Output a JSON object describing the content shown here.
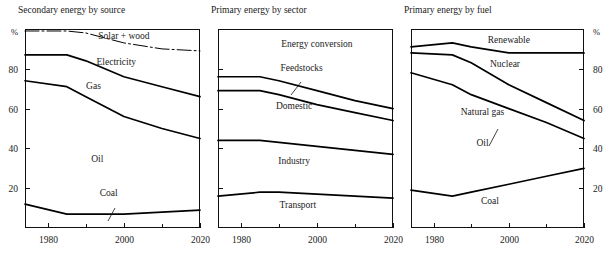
{
  "figure": {
    "width": 615,
    "height": 258,
    "background": "#ffffff",
    "ink_color": "#000000"
  },
  "chart_data": [
    {
      "type": "area",
      "title": "Secondary energy by source",
      "xlabel": "",
      "ylabel": "",
      "yunit": "%",
      "xlim": [
        1974,
        2020
      ],
      "ylim": [
        0,
        100
      ],
      "xticks": [
        1980,
        2000,
        2020
      ],
      "xtick_labels": [
        "1980",
        "2000",
        "2020"
      ],
      "xminorticks": [
        1990,
        2010
      ],
      "yticks": [
        20,
        40,
        60,
        80
      ],
      "ytick_labels": [
        "20",
        "40",
        "60",
        "80"
      ],
      "ytick_side": "left",
      "grid": false,
      "legend": "inline-band-labels",
      "x": [
        1974,
        1985,
        1990,
        2000,
        2010,
        2020
      ],
      "series": [
        {
          "name": "Solar + wood",
          "label": "Solar + wood",
          "label_x": 2000,
          "label_y": 95,
          "boundary_style": "dashed",
          "cumulative_top": [
            99,
            99,
            98,
            93,
            90,
            89
          ]
        },
        {
          "name": "Electricity",
          "label": "Electricity",
          "label_x": 1998,
          "label_y": 82,
          "boundary_style": "solid",
          "cumulative_top": [
            87,
            87,
            84,
            76,
            71,
            66
          ]
        },
        {
          "name": "Gas",
          "label": "Gas",
          "label_x": 1992,
          "label_y": 70,
          "boundary_style": "solid",
          "cumulative_top": [
            74,
            71,
            66,
            56,
            50,
            45
          ]
        },
        {
          "name": "Oil",
          "label": "Oil",
          "label_x": 1993,
          "label_y": 33,
          "boundary_style": "solid",
          "cumulative_top": [
            12,
            7,
            7,
            7,
            8,
            9
          ]
        },
        {
          "name": "Coal",
          "label": "Coal",
          "label_x": 1996,
          "label_y": 16,
          "boundary_style": "none",
          "cumulative_top": [
            0,
            0,
            0,
            0,
            0,
            0
          ]
        }
      ]
    },
    {
      "type": "area",
      "title": "Primary energy by sector",
      "xlabel": "",
      "ylabel": "",
      "yunit": "",
      "xlim": [
        1974,
        2020
      ],
      "ylim": [
        0,
        100
      ],
      "xticks": [
        1980,
        2000,
        2020
      ],
      "xtick_labels": [
        "1980",
        "2000",
        "2020"
      ],
      "xminorticks": [
        1990,
        2010
      ],
      "yticks": [
        20,
        40,
        60,
        80
      ],
      "ytick_labels": [
        "",
        "",
        "",
        ""
      ],
      "ytick_side": "left",
      "grid": false,
      "legend": "inline-band-labels",
      "x": [
        1974,
        1985,
        1990,
        2000,
        2010,
        2020
      ],
      "series": [
        {
          "name": "Energy conversion",
          "label": "Energy conversion",
          "label_x": 2000,
          "label_y": 91,
          "boundary_style": "none",
          "cumulative_top": [
            100,
            100,
            100,
            100,
            100,
            100
          ]
        },
        {
          "name": "Feedstocks",
          "label": "Feedstocks",
          "label_x": 1996,
          "label_y": 79,
          "boundary_style": "solid",
          "cumulative_top": [
            76,
            76,
            74,
            69,
            64,
            60
          ]
        },
        {
          "name": "Domestic",
          "label": "Domestic",
          "label_x": 1994,
          "label_y": 60,
          "boundary_style": "solid",
          "cumulative_top": [
            69,
            69,
            67,
            62,
            58,
            54
          ]
        },
        {
          "name": "Industry",
          "label": "Industry",
          "label_x": 1994,
          "label_y": 32,
          "boundary_style": "solid",
          "cumulative_top": [
            44,
            44,
            43,
            41,
            39,
            37
          ]
        },
        {
          "name": "Transport",
          "label": "Transport",
          "label_x": 1995,
          "label_y": 10,
          "boundary_style": "solid",
          "cumulative_top": [
            16,
            18,
            18,
            17,
            16,
            15
          ]
        }
      ]
    },
    {
      "type": "area",
      "title": "Primary energy by fuel",
      "xlabel": "",
      "ylabel": "",
      "yunit": "%",
      "xlim": [
        1974,
        2020
      ],
      "ylim": [
        0,
        100
      ],
      "xticks": [
        1980,
        2000,
        2020
      ],
      "xtick_labels": [
        "1980",
        "2000",
        "2020"
      ],
      "xminorticks": [
        1990,
        2010
      ],
      "yticks": [
        20,
        40,
        60,
        80
      ],
      "ytick_labels": [
        "20",
        "40",
        "60",
        "80"
      ],
      "ytick_side": "right",
      "grid": false,
      "legend": "inline-band-labels",
      "x": [
        1974,
        1985,
        1990,
        2000,
        2010,
        2020
      ],
      "series": [
        {
          "name": "Renewable",
          "label": "Renewable",
          "label_x": 2000,
          "label_y": 93,
          "boundary_style": "solid",
          "cumulative_top": [
            91,
            93,
            91,
            88,
            88,
            88
          ]
        },
        {
          "name": "Nuclear",
          "label": "Nuclear",
          "label_x": 1999,
          "label_y": 81,
          "boundary_style": "solid",
          "cumulative_top": [
            88,
            87,
            83,
            72,
            63,
            54
          ]
        },
        {
          "name": "Natural gas",
          "label": "Natural gas",
          "label_x": 1993,
          "label_y": 57,
          "boundary_style": "solid",
          "cumulative_top": [
            78,
            72,
            67,
            60,
            53,
            45
          ]
        },
        {
          "name": "Oil",
          "label": "Oil",
          "label_x": 1993,
          "label_y": 41,
          "boundary_style": "solid",
          "cumulative_top": [
            19,
            16,
            18,
            22,
            26,
            30
          ]
        },
        {
          "name": "Coal",
          "label": "Coal",
          "label_x": 1995,
          "label_y": 12,
          "boundary_style": "none",
          "cumulative_top": [
            0,
            0,
            0,
            0,
            0,
            0
          ]
        }
      ]
    }
  ]
}
